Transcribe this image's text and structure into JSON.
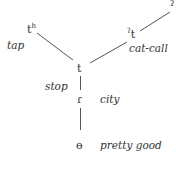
{
  "diagram": {
    "type": "tree",
    "line_color": "#555555",
    "nodes": {
      "aspirated": {
        "base": "t",
        "modifier": "h",
        "gloss": "tap"
      },
      "glottalized": {
        "prefix": "ʔ",
        "base": "t",
        "gloss": "cat-call"
      },
      "glottal_stop": {
        "symbol": "ʔ"
      },
      "plain": {
        "symbol": "t",
        "gloss": "stop"
      },
      "flap": {
        "symbol": "ɾ",
        "gloss": "city"
      },
      "zero": {
        "symbol": "ɵ",
        "gloss": "pretty good"
      }
    },
    "edges": [
      [
        "aspirated",
        "plain"
      ],
      [
        "glottalized",
        "plain"
      ],
      [
        "glottalized",
        "glottal_stop"
      ],
      [
        "plain",
        "flap"
      ],
      [
        "flap",
        "zero"
      ]
    ]
  }
}
